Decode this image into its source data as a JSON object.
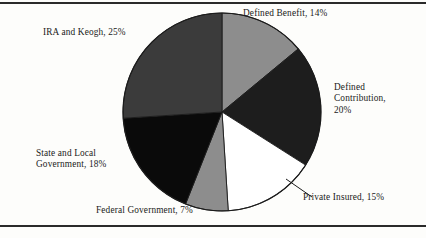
{
  "figure": {
    "top_rule": "",
    "bottom_rule": "",
    "caption_partial": ""
  },
  "chart_data": {
    "type": "pie",
    "title": "",
    "xlabel": "",
    "ylabel": "",
    "legend_position": "callout-labels",
    "grid": false,
    "start_angle_deg": 0,
    "direction": "clockwise",
    "categories": [
      "Defined Benefit",
      "Defined Contribution",
      "Private Insured",
      "Federal Government",
      "State and Local Government",
      "IRA and Keogh"
    ],
    "values": [
      14,
      20,
      15,
      7,
      18,
      25
    ],
    "value_unit": "%",
    "colors": [
      "#8d8d8d",
      "#1d1d1d",
      "#ffffff",
      "#8d8d8d",
      "#0a0a0a",
      "#3b3b3b"
    ],
    "slices": [
      {
        "name": "Defined Benefit",
        "value": 14,
        "label": "Defined Benefit, 14%",
        "color": "#8d8d8d",
        "start_deg": 0,
        "end_deg": 50.4
      },
      {
        "name": "Defined Contribution",
        "value": 20,
        "label": "Defined\nContribution,\n20%",
        "color": "#1d1d1d",
        "start_deg": 50.4,
        "end_deg": 122.4
      },
      {
        "name": "Private Insured",
        "value": 15,
        "label": "Private Insured, 15%",
        "color": "#ffffff",
        "start_deg": 122.4,
        "end_deg": 176.4
      },
      {
        "name": "Federal Government",
        "value": 7,
        "label": "Federal Government, 7%",
        "color": "#8d8d8d",
        "start_deg": 176.4,
        "end_deg": 201.6
      },
      {
        "name": "State and Local Government",
        "value": 18,
        "label": "State and Local\nGovernment, 18%",
        "color": "#0a0a0a",
        "start_deg": 201.6,
        "end_deg": 266.4
      },
      {
        "name": "IRA and Keogh",
        "value": 25,
        "label": "IRA and Keogh, 25%",
        "color": "#3b3b3b",
        "start_deg": 266.4,
        "end_deg": 360
      }
    ]
  }
}
